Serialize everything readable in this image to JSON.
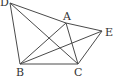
{
  "diagram": {
    "type": "geometry",
    "points": [
      {
        "id": "D",
        "label": "D",
        "x": 10,
        "y": 3,
        "lx": 0,
        "ly": 6
      },
      {
        "id": "A",
        "label": "A",
        "x": 66,
        "y": 23,
        "lx": 63,
        "ly": 20
      },
      {
        "id": "E",
        "label": "E",
        "x": 102,
        "y": 31,
        "lx": 105,
        "ly": 36
      },
      {
        "id": "B",
        "label": "B",
        "x": 20,
        "y": 64,
        "lx": 16,
        "ly": 76
      },
      {
        "id": "C",
        "label": "C",
        "x": 78,
        "y": 64,
        "lx": 74,
        "ly": 76
      }
    ],
    "segments": [
      [
        "D",
        "B"
      ],
      [
        "D",
        "A"
      ],
      [
        "A",
        "E"
      ],
      [
        "D",
        "C"
      ],
      [
        "B",
        "A"
      ],
      [
        "B",
        "E"
      ],
      [
        "B",
        "C"
      ],
      [
        "A",
        "C"
      ],
      [
        "C",
        "E"
      ]
    ],
    "stroke_color": "#4a4a4a"
  }
}
